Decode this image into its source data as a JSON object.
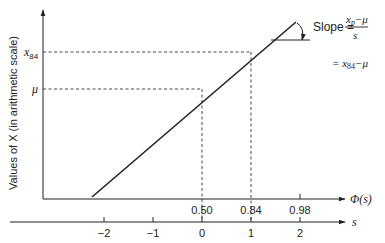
{
  "diagram": {
    "y_axis_label": "Values of X (in arithmetic scale)",
    "y_ticks": [
      {
        "label": "x",
        "sub": "84",
        "y": 52
      },
      {
        "label": "μ",
        "sub": "",
        "y": 89
      }
    ],
    "phi_axis": {
      "label": "Φ(s)",
      "ticks": [
        {
          "label": "0.50",
          "x": 202
        },
        {
          "label": "0.84",
          "x": 251
        },
        {
          "label": "0.98",
          "x": 300
        }
      ]
    },
    "s_axis": {
      "label": "s",
      "ticks": [
        {
          "label": "−2",
          "x": 104
        },
        {
          "label": "−1",
          "x": 153
        },
        {
          "label": "0",
          "x": 202
        },
        {
          "label": "1",
          "x": 251
        },
        {
          "label": "2",
          "x": 300
        }
      ]
    },
    "slope_annotation": {
      "prefix": "Slope =",
      "numerator_x": "x",
      "numerator_sub": "p",
      "numerator_rest": "−μ",
      "denominator": "s",
      "second_line_prefix": "= x",
      "second_line_sub": "84",
      "second_line_rest": "−μ"
    },
    "colors": {
      "line": "#222222",
      "text": "#222222",
      "background": "#ffffff"
    }
  }
}
